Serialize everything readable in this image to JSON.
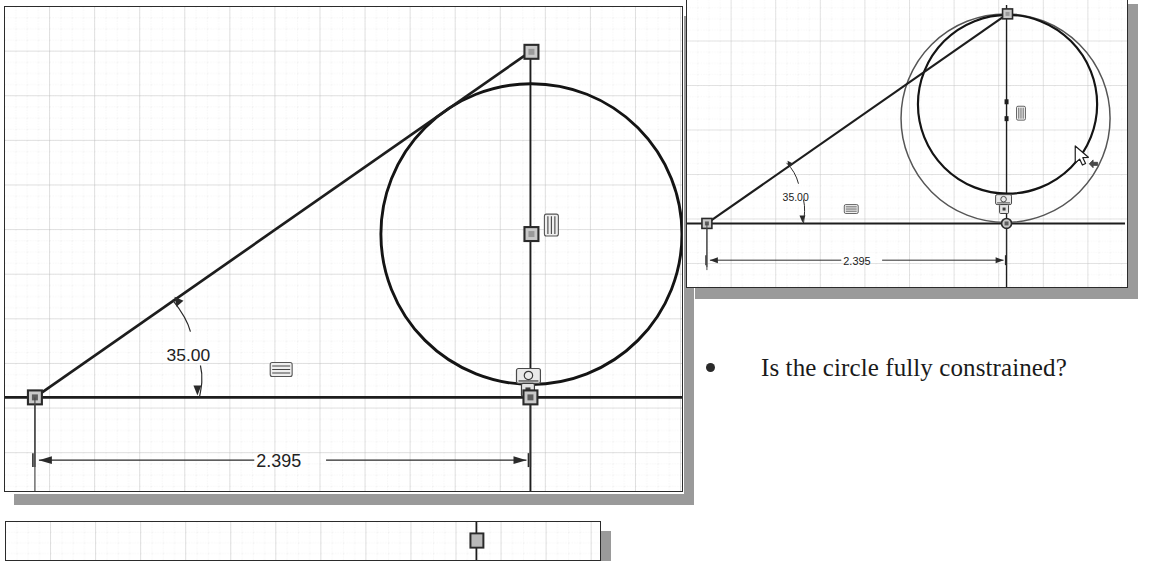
{
  "document": {
    "kind": "cad-sketch-lecture-slide",
    "background_color": "#ffffff",
    "shadow_color": "#9a9a9a"
  },
  "bullet": {
    "marker": "bullet-dot",
    "text": "Is the circle fully constrained?"
  },
  "panels": [
    {
      "id": "main-panel",
      "name": "main-sketch-view",
      "border_color": "#2b2b2b",
      "grid": {
        "minor_spacing_x": 11.3,
        "minor_spacing_y": 11.2,
        "major_every": 4,
        "minor_color": "#d9d9d9",
        "major_color": "#c4c4c4"
      },
      "dimensions": [
        {
          "name": "angle-dimension",
          "value": "35.00",
          "type": "angular"
        },
        {
          "name": "linear-dimension",
          "value": "2.395",
          "type": "horizontal-linear"
        }
      ],
      "constraints": [
        {
          "name": "horizontal-constraint-icon",
          "glyph": "horizontal"
        },
        {
          "name": "vertical-constraint-icon",
          "glyph": "vertical"
        },
        {
          "name": "tangent-constraint-icon",
          "glyph": "tangent"
        },
        {
          "name": "coincident-constraint-icon",
          "glyph": "coincident"
        }
      ],
      "entities": [
        {
          "name": "origin-point",
          "type": "point"
        },
        {
          "name": "inclined-line",
          "type": "line"
        },
        {
          "name": "horizontal-axis-line",
          "type": "line"
        },
        {
          "name": "vertical-axis-line",
          "type": "line"
        },
        {
          "name": "sketch-circle",
          "type": "circle"
        },
        {
          "name": "line-top-endpoint",
          "type": "point"
        },
        {
          "name": "circle-center-point",
          "type": "point"
        },
        {
          "name": "circle-bottom-point",
          "type": "point"
        }
      ]
    },
    {
      "id": "inset-panel",
      "name": "inset-sketch-view",
      "border_color": "#2b2b2b",
      "grid": {
        "minor_spacing_x": 11.2,
        "minor_spacing_y": 11.2,
        "major_every": 4,
        "minor_color": "#dcdcdc",
        "major_color": "#c8c8c8"
      },
      "dimensions": [
        {
          "name": "angle-dimension",
          "value": "35.00",
          "type": "angular"
        },
        {
          "name": "linear-dimension",
          "value": "2.395",
          "type": "horizontal-linear"
        }
      ],
      "constraints": [
        {
          "name": "horizontal-constraint-icon",
          "glyph": "horizontal"
        },
        {
          "name": "vertical-constraint-icon",
          "glyph": "vertical"
        },
        {
          "name": "tangent-constraint-icon",
          "glyph": "tangent"
        },
        {
          "name": "coincident-constraint-icon",
          "glyph": "coincident"
        }
      ],
      "entities": [
        {
          "name": "origin-point",
          "type": "point"
        },
        {
          "name": "inclined-line",
          "type": "line"
        },
        {
          "name": "sketch-circle",
          "type": "circle"
        },
        {
          "name": "dragged-circle-preview",
          "type": "circle"
        },
        {
          "name": "mouse-cursor-drag",
          "type": "cursor"
        }
      ]
    },
    {
      "id": "bottom-panel",
      "name": "bottom-partial-sketch-view",
      "border_color": "#2b2b2b",
      "grid": {
        "minor_spacing_x": 11.3,
        "minor_spacing_y": 11.2,
        "major_every": 4,
        "minor_color": "#d9d9d9",
        "major_color": "#c4c4c4"
      },
      "entities": [
        {
          "name": "vertical-axis-line",
          "type": "line"
        },
        {
          "name": "point-marker",
          "type": "point"
        }
      ]
    }
  ],
  "labels": {
    "main_angle": "35.00",
    "main_linear": "2.395",
    "inset_angle": "35.00",
    "inset_linear": "2.395"
  }
}
